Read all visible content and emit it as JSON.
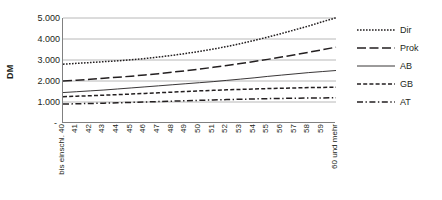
{
  "chart_data": {
    "type": "line",
    "title": "",
    "xlabel": "",
    "ylabel": "DM",
    "ylim": [
      0,
      5000
    ],
    "yticks": [
      "-",
      "1.000",
      "2.000",
      "3.000",
      "4.000",
      "5.000"
    ],
    "ytick_values": [
      0,
      1000,
      2000,
      3000,
      4000,
      5000
    ],
    "grid": true,
    "legend_position": "right",
    "categories": [
      "bis einschl. 40",
      "41",
      "42",
      "43",
      "44",
      "45",
      "46",
      "47",
      "48",
      "49",
      "50",
      "51",
      "52",
      "53",
      "54",
      "55",
      "56",
      "57",
      "58",
      "59",
      "60 und mehr"
    ],
    "series": [
      {
        "name": "Dir",
        "style": "dotted",
        "values": [
          2800,
          2840,
          2880,
          2920,
          2960,
          3010,
          3070,
          3140,
          3220,
          3310,
          3410,
          3520,
          3640,
          3780,
          3930,
          4090,
          4260,
          4440,
          4620,
          4820,
          5010
        ]
      },
      {
        "name": "Prok",
        "style": "long-dash",
        "values": [
          2000,
          2040,
          2080,
          2130,
          2180,
          2230,
          2290,
          2350,
          2420,
          2490,
          2570,
          2650,
          2740,
          2830,
          2930,
          3030,
          3140,
          3250,
          3370,
          3490,
          3610
        ]
      },
      {
        "name": "AB",
        "style": "solid",
        "values": [
          1450,
          1490,
          1530,
          1570,
          1620,
          1670,
          1720,
          1770,
          1820,
          1870,
          1920,
          1970,
          2030,
          2090,
          2150,
          2220,
          2280,
          2340,
          2400,
          2450,
          2500
        ]
      },
      {
        "name": "GB",
        "style": "dashed",
        "values": [
          1250,
          1275,
          1300,
          1325,
          1350,
          1380,
          1410,
          1440,
          1470,
          1500,
          1530,
          1555,
          1580,
          1600,
          1620,
          1640,
          1655,
          1670,
          1685,
          1695,
          1700
        ]
      },
      {
        "name": "AT",
        "style": "dash-dot",
        "values": [
          900,
          915,
          930,
          945,
          960,
          980,
          1000,
          1020,
          1040,
          1060,
          1080,
          1100,
          1115,
          1130,
          1145,
          1160,
          1170,
          1180,
          1190,
          1195,
          1200
        ]
      }
    ],
    "colors": {
      "line": "#231f20",
      "grid": "#a6a6a6",
      "axis": "#808080",
      "background": "#ffffff"
    }
  }
}
